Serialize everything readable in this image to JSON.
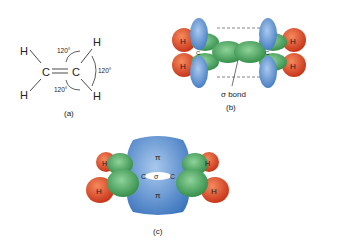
{
  "panels": {
    "a": {
      "caption": "(a)",
      "atoms": {
        "h": "H",
        "c": "C"
      },
      "angles": [
        "120°",
        "120°",
        "120°"
      ]
    },
    "b": {
      "caption": "(b)",
      "atoms": {
        "h": "H",
        "c": "C"
      },
      "bond_label": "σ bond"
    },
    "c": {
      "caption": "(c)",
      "atoms": {
        "h": "H",
        "c": "C"
      },
      "pi_label": "π",
      "sigma_label": "σ"
    }
  },
  "colors": {
    "hydrogen": "#e0502a",
    "sp2_orbital": "#3f9a55",
    "p_orbital": "#4f86c8",
    "text": "#222222"
  }
}
